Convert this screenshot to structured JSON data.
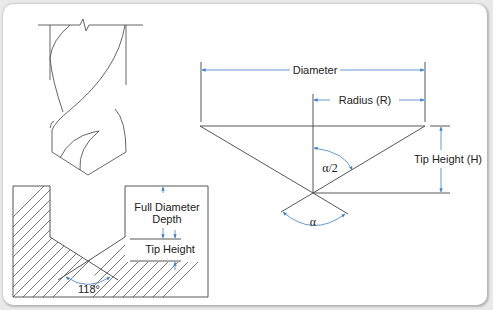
{
  "figure": {
    "colors": {
      "line": "#444444",
      "dimension": "#3d7fc9",
      "background": "#ffffff",
      "frame": "#d0d0d0"
    }
  },
  "drill_bit_sketch": {
    "description": "Twist drill bit with break line at shank"
  },
  "hole_section": {
    "labels": {
      "full_diameter_depth_line1": "Full Diameter",
      "full_diameter_depth_line2": "Depth",
      "tip_height": "Tip Height",
      "angle": "118°"
    }
  },
  "tip_geometry": {
    "labels": {
      "diameter": "Diameter",
      "radius": "Radius (R)",
      "tip_height": "Tip Height (H)",
      "half_angle": "α/2",
      "angle": "α"
    }
  }
}
